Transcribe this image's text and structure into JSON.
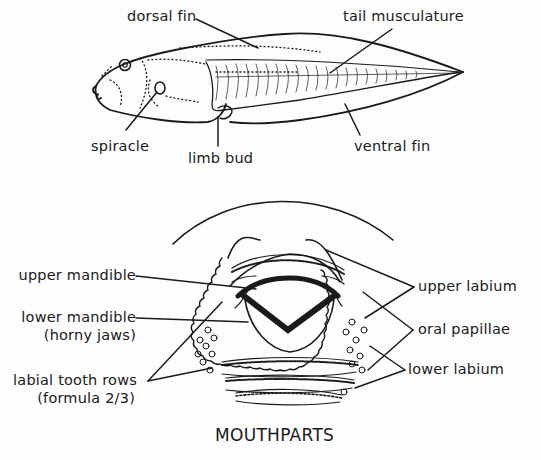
{
  "diagram": {
    "tadpole": {
      "labels": {
        "dorsal_fin": "dorsal fin",
        "tail_musculature": "tail musculature",
        "spiracle": "spiracle",
        "limb_bud": "limb bud",
        "ventral_fin": "ventral fin"
      }
    },
    "mouthparts": {
      "title": "MOUTHPARTS",
      "labels": {
        "upper_mandible": "upper mandible",
        "lower_mandible": "lower mandible",
        "lower_mandible_note": "(horny jaws)",
        "labial_tooth_rows": "labial tooth rows",
        "labial_tooth_rows_note": "(formula 2/3)",
        "upper_labium": "upper labium",
        "oral_papillae": "oral papillae",
        "lower_labium": "lower labium"
      }
    }
  }
}
